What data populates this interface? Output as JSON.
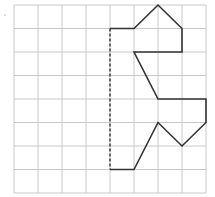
{
  "diagram": {
    "type": "grid-symmetry-figure",
    "grid": {
      "columns": 8,
      "rows": 8,
      "origin_px": [
        14,
        5
      ],
      "cell_px": [
        24,
        23.5
      ],
      "line_color": "#c8c8c8"
    },
    "mirror_line": {
      "style": "dashed",
      "from": [
        4,
        1
      ],
      "to": [
        4,
        7
      ],
      "color": "#333333"
    },
    "figure_path": {
      "style": "solid",
      "color": "#333333",
      "points": [
        [
          4,
          1
        ],
        [
          5,
          1
        ],
        [
          6,
          0
        ],
        [
          7,
          1
        ],
        [
          7,
          2
        ],
        [
          5,
          2
        ],
        [
          6,
          4
        ],
        [
          8,
          4
        ],
        [
          8,
          5
        ],
        [
          7,
          6
        ],
        [
          6,
          5
        ],
        [
          5,
          7
        ],
        [
          4,
          7
        ]
      ]
    }
  }
}
